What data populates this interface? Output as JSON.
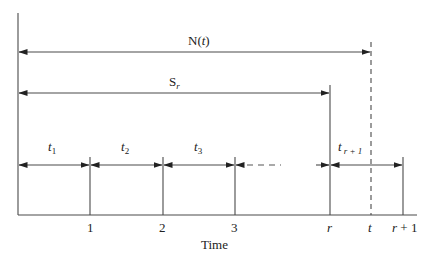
{
  "diagram": {
    "top_arrows": {
      "n_of_t": {
        "label": "N(",
        "var": "t",
        "close": ")"
      },
      "s_r": {
        "label": "S",
        "sub": "r"
      }
    },
    "intervals": [
      {
        "label": "t",
        "sub": "1"
      },
      {
        "label": "t",
        "sub": "2"
      },
      {
        "label": "t",
        "sub": "3"
      },
      {
        "label": "t",
        "sub": "r + 1"
      }
    ],
    "ticks": [
      {
        "label": "1",
        "italic": false
      },
      {
        "label": "2",
        "italic": false
      },
      {
        "label": "3",
        "italic": false
      },
      {
        "label": "r",
        "italic": true
      },
      {
        "label": "t",
        "italic": true
      },
      {
        "label": "r",
        "suffix": " + 1",
        "italic": true
      }
    ],
    "xlabel": "Time",
    "colors": {
      "line": "#4a4a4a",
      "text": "#222222",
      "background": "#ffffff"
    }
  }
}
